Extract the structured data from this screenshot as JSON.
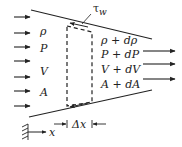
{
  "diagram": {
    "type": "control-volume-flow-duct",
    "inlet_labels": [
      "ρ",
      "P",
      "V",
      "A"
    ],
    "outlet_labels": [
      "ρ + dρ",
      "P + dP",
      "V + dV",
      "A + dA"
    ],
    "wall_shear_label": "τ_w",
    "wall_shear_symbol": "τ",
    "wall_shear_subscript": "w",
    "axis_label": "x",
    "element_width_label": "Δx",
    "line_color": "#222222",
    "background_color": "#ffffff"
  }
}
